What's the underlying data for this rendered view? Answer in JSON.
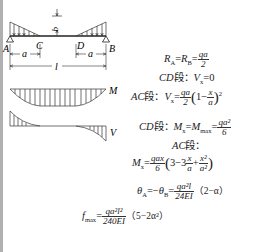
{
  "diagram": {
    "type": "simply-supported beam with triangular end loads",
    "labels": {
      "load": "q",
      "support_left": "A",
      "support_right": "B",
      "point_c": "C",
      "point_d": "D",
      "dim_left": "a",
      "dim_right": "a",
      "span": "l",
      "moment_diagram": "M",
      "shear_diagram": "V"
    }
  },
  "formulas": {
    "reactions": {
      "lhs": "R",
      "sub_a": "A",
      "eq": "=",
      "lhs2": "R",
      "sub_b": "B",
      "eq2": "=",
      "num": "qa",
      "den": "2"
    },
    "cd_shear": {
      "seg": "CD",
      "duan": "段：",
      "v": "V",
      "sub": "x",
      "rhs": "=0"
    },
    "ac_shear": {
      "seg": "AC",
      "duan": "段：",
      "v": "V",
      "sub": "x",
      "eq": "=",
      "num": "qa",
      "den": "2",
      "open": "(",
      "one": "1−",
      "fnum": "x",
      "fden": "a",
      "close": ")",
      "pow": "2"
    },
    "cd_moment": {
      "seg": "CD",
      "duan": "段：",
      "m": "M",
      "sub": "x",
      "eq": "=",
      "m2": "M",
      "sub2": "max",
      "eq2": "=",
      "num": "qa²",
      "den": "6"
    },
    "ac_label": {
      "seg": "AC",
      "duan": "段："
    },
    "ac_moment": {
      "m": "M",
      "sub": "x",
      "eq": "=",
      "num": "qax",
      "den": "6",
      "open": "(",
      "three": "3−3",
      "f1num": "x",
      "f1den": "a",
      "plus": "+",
      "f2num": "x²",
      "f2den": "a²",
      "close": ")"
    },
    "rotation": {
      "th": "θ",
      "sub_a": "A",
      "eq": "=−",
      "th2": "θ",
      "sub_b": "B",
      "eq2": "=",
      "num": "qa²l",
      "den": "24EI",
      "tail": "（2−α）"
    },
    "deflection": {
      "f": "f",
      "sub": "max",
      "eq": "=",
      "num": "qa²l²",
      "den": "240EI",
      "tail": "（5−2α²）"
    }
  }
}
